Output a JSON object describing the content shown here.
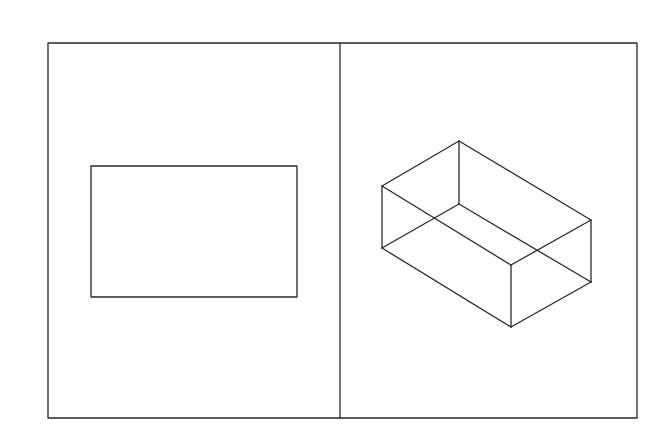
{
  "diagram": {
    "colors": {
      "background": "#ffffff",
      "stroke": "#2a2a2a"
    },
    "frame": {
      "x": 48,
      "y": 43,
      "width": 589,
      "height": 375,
      "divider_x": 340
    },
    "left_panel": {
      "shape": "rectangle",
      "rect": {
        "x": 91,
        "y": 166,
        "width": 206,
        "height": 131
      }
    },
    "right_panel": {
      "shape": "wireframe-box",
      "vertices": {
        "top_back": [
          459,
          141
        ],
        "left_top": [
          382,
          186
        ],
        "left_bottom": [
          382,
          248
        ],
        "inner_bottom": [
          459,
          204
        ],
        "front_top": [
          511,
          265
        ],
        "front_bottom": [
          511,
          327
        ],
        "right_top": [
          591,
          220
        ],
        "right_bottom": [
          591,
          282
        ]
      }
    }
  }
}
